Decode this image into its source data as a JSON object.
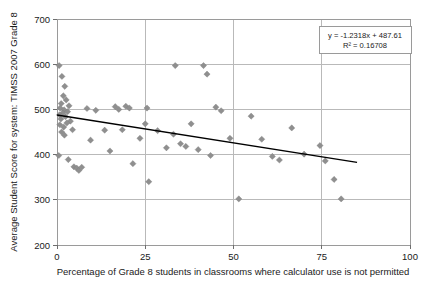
{
  "chart_data": {
    "type": "scatter",
    "title": "",
    "xlabel": "Percentage of Grade 8 students in classrooms where calculator use is not permitted",
    "ylabel": "Average Student Score for system: TIMSS 2007 Grade 8",
    "xlim": [
      0,
      100
    ],
    "ylim": [
      200,
      700
    ],
    "xticks": [
      0,
      25,
      50,
      75,
      100
    ],
    "yticks": [
      200,
      300,
      400,
      500,
      600,
      700
    ],
    "xtick_labels": [
      "0",
      "25",
      "50",
      "75",
      "100"
    ],
    "ytick_labels": [
      "200",
      "300",
      "400",
      "500",
      "600",
      "700"
    ],
    "grid": true,
    "legend": "none",
    "marker_shape": "diamond",
    "marker_color": "#8f8f8f",
    "trendline": {
      "equation": "y = -1.2318x + 487.61",
      "r_squared_label": "R² = 0.16708",
      "slope": -1.2318,
      "intercept": 487.61,
      "r_squared": 0.16708,
      "x_start": 0,
      "x_end": 85,
      "color": "#000000"
    },
    "points": [
      {
        "x": 0.6,
        "y": 597
      },
      {
        "x": 1.4,
        "y": 573
      },
      {
        "x": 2.2,
        "y": 551
      },
      {
        "x": 1.8,
        "y": 530
      },
      {
        "x": 2.6,
        "y": 521
      },
      {
        "x": 1.2,
        "y": 513
      },
      {
        "x": 3.4,
        "y": 508
      },
      {
        "x": 0.9,
        "y": 503
      },
      {
        "x": 2.0,
        "y": 499
      },
      {
        "x": 3.0,
        "y": 495
      },
      {
        "x": 1.6,
        "y": 492
      },
      {
        "x": 0.7,
        "y": 488
      },
      {
        "x": 2.4,
        "y": 484
      },
      {
        "x": 1.1,
        "y": 479
      },
      {
        "x": 3.8,
        "y": 474
      },
      {
        "x": 2.8,
        "y": 470
      },
      {
        "x": 0.8,
        "y": 466
      },
      {
        "x": 1.9,
        "y": 461
      },
      {
        "x": 4.4,
        "y": 455
      },
      {
        "x": 1.3,
        "y": 450
      },
      {
        "x": 2.1,
        "y": 443
      },
      {
        "x": 0.5,
        "y": 398
      },
      {
        "x": 3.2,
        "y": 389
      },
      {
        "x": 4.8,
        "y": 373
      },
      {
        "x": 5.6,
        "y": 370
      },
      {
        "x": 6.2,
        "y": 365
      },
      {
        "x": 7.0,
        "y": 372
      },
      {
        "x": 8.5,
        "y": 502
      },
      {
        "x": 11.0,
        "y": 498
      },
      {
        "x": 9.5,
        "y": 432
      },
      {
        "x": 13.5,
        "y": 454
      },
      {
        "x": 16.5,
        "y": 506
      },
      {
        "x": 17.5,
        "y": 500
      },
      {
        "x": 15.0,
        "y": 408
      },
      {
        "x": 19.5,
        "y": 507
      },
      {
        "x": 20.5,
        "y": 503
      },
      {
        "x": 18.5,
        "y": 455
      },
      {
        "x": 21.5,
        "y": 380
      },
      {
        "x": 23.5,
        "y": 436
      },
      {
        "x": 25.0,
        "y": 468
      },
      {
        "x": 25.5,
        "y": 503
      },
      {
        "x": 26.0,
        "y": 340
      },
      {
        "x": 28.5,
        "y": 453
      },
      {
        "x": 31.0,
        "y": 415
      },
      {
        "x": 33.5,
        "y": 597
      },
      {
        "x": 33.0,
        "y": 445
      },
      {
        "x": 35.0,
        "y": 424
      },
      {
        "x": 36.5,
        "y": 418
      },
      {
        "x": 38.0,
        "y": 468
      },
      {
        "x": 41.5,
        "y": 597
      },
      {
        "x": 42.5,
        "y": 578
      },
      {
        "x": 40.0,
        "y": 411
      },
      {
        "x": 43.5,
        "y": 398
      },
      {
        "x": 45.0,
        "y": 505
      },
      {
        "x": 46.5,
        "y": 497
      },
      {
        "x": 49.0,
        "y": 436
      },
      {
        "x": 51.5,
        "y": 302
      },
      {
        "x": 55.0,
        "y": 485
      },
      {
        "x": 58.0,
        "y": 434
      },
      {
        "x": 61.0,
        "y": 396
      },
      {
        "x": 63.0,
        "y": 388
      },
      {
        "x": 66.5,
        "y": 459
      },
      {
        "x": 70.0,
        "y": 401
      },
      {
        "x": 74.5,
        "y": 420
      },
      {
        "x": 76.0,
        "y": 386
      },
      {
        "x": 78.5,
        "y": 345
      },
      {
        "x": 80.5,
        "y": 302
      }
    ]
  }
}
